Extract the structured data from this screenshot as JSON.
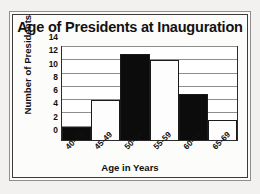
{
  "chart_data": {
    "type": "bar",
    "title": "Age of Presidents at Inauguration",
    "xlabel": "Age in Years",
    "ylabel": "Number of Presidents",
    "categories": [
      "40-44",
      "45-49",
      "50-54",
      "55-59",
      "60-64",
      "65-69"
    ],
    "values": [
      2,
      6,
      13,
      12,
      7,
      3
    ],
    "yticks": [
      0,
      2,
      4,
      6,
      8,
      10,
      12,
      14
    ],
    "ylim": [
      0,
      14
    ],
    "grid": true,
    "legend": "none",
    "bar_fills": [
      "dark",
      "light",
      "dark",
      "light",
      "dark",
      "light"
    ],
    "colors": {
      "bar_dark": "#0c0c0c",
      "bar_light": "#fdfdfd",
      "bar_edge": "#1a1a1a",
      "grid": "#8d8d8d",
      "axis": "#2b2b2b",
      "text": "#101010",
      "background": "#fcfcfb",
      "frame": "#3a3a3a"
    }
  }
}
